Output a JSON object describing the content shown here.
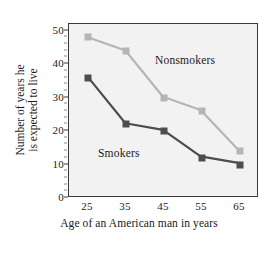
{
  "chart_data": {
    "type": "line",
    "title": "",
    "xlabel": "Age of an American man in years",
    "ylabel": "Number of years he is expected to live",
    "ylabel_line1": "Number of years he",
    "ylabel_line2": "is expected to live",
    "categories": [
      25,
      35,
      45,
      55,
      65
    ],
    "x_tick_labels": [
      "25",
      "35",
      "45",
      "55",
      "65"
    ],
    "y_tick_labels": [
      "0",
      "10",
      "20",
      "30",
      "40",
      "50"
    ],
    "y_ticks": [
      0,
      10,
      20,
      30,
      40,
      50
    ],
    "xlim": [
      20,
      70
    ],
    "ylim": [
      0,
      52
    ],
    "grid": false,
    "legend_position": "inline-annotation",
    "series": [
      {
        "name": "Nonsmokers",
        "color": "#b5b5b5",
        "values": [
          48,
          44,
          30,
          26,
          14
        ]
      },
      {
        "name": "Smokers",
        "color": "#4d4d4d",
        "values": [
          36,
          22,
          20,
          12,
          10
        ]
      }
    ],
    "annotations": [
      {
        "text": "Nonsmokers",
        "series": "Nonsmokers"
      },
      {
        "text": "Smokers",
        "series": "Smokers"
      }
    ]
  },
  "style": {
    "plot_background": "#f2f2f2",
    "frame_color": "#3a3a3a",
    "text_color": "#1a1a1a",
    "page_background": "#ffffff"
  }
}
